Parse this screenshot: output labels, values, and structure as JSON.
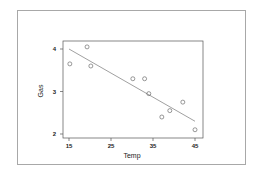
{
  "chart_data": {
    "type": "scatter",
    "title": "",
    "xlabel": "Temp",
    "ylabel": "Gas",
    "xlim": [
      14,
      46
    ],
    "ylim": [
      1.95,
      4.15
    ],
    "xticks": [
      15,
      25,
      35,
      45
    ],
    "yticks": [
      2,
      3,
      4
    ],
    "grid": false,
    "legend": null,
    "series": [
      {
        "name": "observations",
        "marker": "open-circle",
        "x": [
          15.2,
          19.3,
          20.2,
          30.2,
          33.0,
          34.0,
          37.1,
          39.0,
          42.1,
          45.0
        ],
        "y": [
          3.65,
          4.05,
          3.6,
          3.3,
          3.3,
          2.95,
          2.4,
          2.55,
          2.75,
          2.1
        ]
      }
    ],
    "fit_line": {
      "type": "linear",
      "x": [
        15,
        45
      ],
      "y": [
        4.0,
        2.3
      ]
    }
  },
  "labels": {
    "xlabel": "Temp",
    "ylabel": "Gas",
    "xticks": [
      "15",
      "25",
      "35",
      "45"
    ],
    "yticks": [
      "2",
      "3",
      "4"
    ]
  },
  "colors": {
    "frame": "#a8a8a8",
    "axis": "#555555",
    "points": "#555555",
    "line": "#777777"
  }
}
